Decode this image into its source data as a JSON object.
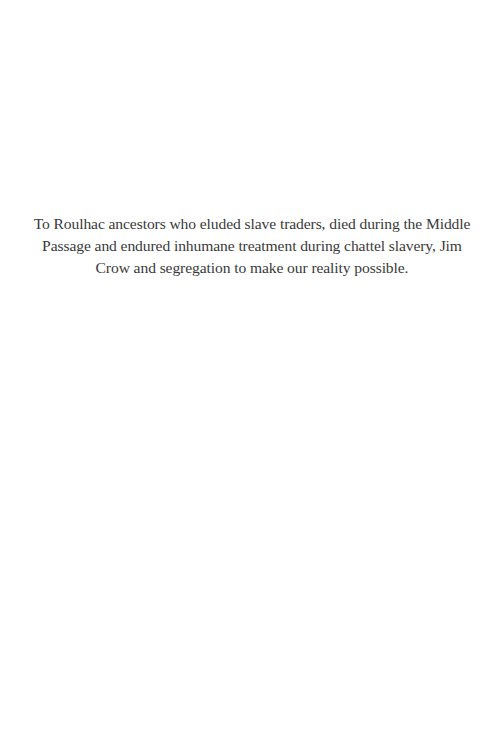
{
  "page": {
    "type": "dedication",
    "background": "#ffffff",
    "text_color": "#3a3a3a"
  },
  "dedication": {
    "lines": [
      "To Roulhac ancestors who eluded slave traders, died during the Middle",
      "Passage and endured inhumane treatment during chattel slavery, Jim",
      "Crow and segregation to make our reality possible."
    ]
  }
}
